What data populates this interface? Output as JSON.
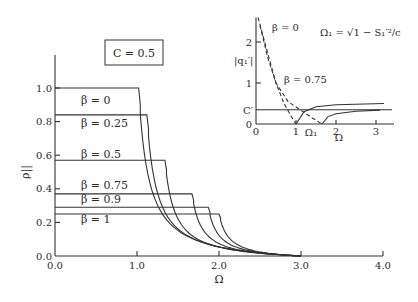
{
  "chart_data": [
    {
      "type": "line",
      "title": "",
      "annotation_box": "C = 0.5",
      "xlabel": "Ω",
      "ylabel": "ρ||",
      "xlim": [
        0.0,
        4.0
      ],
      "ylim": [
        0.0,
        1.2
      ],
      "xticks": [
        "0.0",
        "1.0",
        "2.0",
        "3.0",
        "4.0"
      ],
      "yticks": [
        "0.0",
        "0.2",
        "0.4",
        "0.6",
        "0.8",
        "1.0"
      ],
      "grid": false,
      "series": [
        {
          "name": "β = 0",
          "plateau": 1.0,
          "cutoff": 1.02
        },
        {
          "name": "β = 0.25",
          "plateau": 0.84,
          "cutoff": 1.12
        },
        {
          "name": "β = 0.5",
          "plateau": 0.57,
          "cutoff": 1.34
        },
        {
          "name": "β = 0.75",
          "plateau": 0.37,
          "cutoff": 1.67
        },
        {
          "name": "β = 0.9",
          "plateau": 0.29,
          "cutoff": 1.87
        },
        {
          "name": "β = 1",
          "plateau": 0.25,
          "cutoff": 2.0
        }
      ],
      "note": "Each curve is flat at its plateau value until the cutoff Ω, then decays rapidly toward 0 by Ω ≈ 3.0"
    },
    {
      "type": "line",
      "title": "inset",
      "annotation": "Ω1 = √(1 − S1'^2 / c)",
      "xlabel": "Ω",
      "ylabel": "|q1'|",
      "xlim": [
        0,
        3.4
      ],
      "ylim": [
        0,
        2.6
      ],
      "xticks": [
        "0",
        "1",
        "2",
        "3"
      ],
      "yticks": [
        "0",
        "1",
        "2"
      ],
      "extra_labels": {
        "C'": 0.35,
        "Ω1": 1.3
      },
      "series": [
        {
          "name": "β = 0",
          "style": "dashed",
          "x": [
            0.05,
            0.3,
            0.5,
            0.7,
            0.9,
            1.0
          ],
          "y": [
            2.6,
            1.7,
            1.0,
            0.5,
            0.15,
            0.0
          ]
        },
        {
          "name": "β = 0.75",
          "style": "dashed",
          "x": [
            0.1,
            0.3,
            0.5,
            0.8,
            1.1,
            1.4,
            1.65
          ],
          "y": [
            2.4,
            1.6,
            1.0,
            0.55,
            0.35,
            0.15,
            0.0
          ]
        },
        {
          "name": "C' level",
          "style": "solid",
          "x": [
            0,
            3.4
          ],
          "y": [
            0.35,
            0.35
          ]
        },
        {
          "name": "β = 0 solid",
          "style": "solid",
          "x": [
            1.0,
            1.2,
            1.5,
            2.0,
            3.2
          ],
          "y": [
            0.0,
            0.3,
            0.42,
            0.47,
            0.5
          ]
        },
        {
          "name": "β = 0.75 solid",
          "style": "solid",
          "x": [
            1.65,
            1.8,
            2.0,
            2.5,
            3.1
          ],
          "y": [
            0.0,
            0.18,
            0.25,
            0.31,
            0.34
          ]
        }
      ]
    }
  ],
  "labels": {
    "box": "C = 0.5",
    "xlabel": "Ω",
    "ylabel": "ρ||",
    "inset_formula": "Ω₁ = √1 − S₁′²/c",
    "inset_ylabel": "|q₁′|",
    "inset_xlabel": "Ω",
    "inset_c": "C′",
    "inset_omega1": "Ω₁",
    "inset_beta0": "β = 0",
    "inset_beta075": "β = 0.75"
  }
}
